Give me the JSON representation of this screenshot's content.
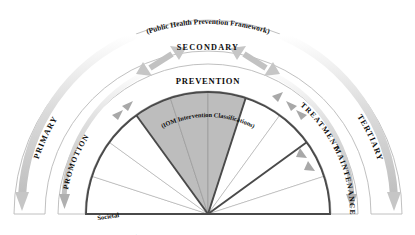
{
  "diagram": {
    "title": "(Public Health Prevention Framework)",
    "center_label_main": "PREVENTION",
    "center_label_sub": "(IOM Intervention Classifications)",
    "outer_ring": {
      "left": "PRIMARY",
      "top": "SECONDARY",
      "right": "TERTIARY"
    },
    "middle_ring": {
      "left": "PROMOTION",
      "right_upper": "TREATMENT",
      "right_lower": "MAINTENANCE"
    },
    "wedges": [
      {
        "label": "Societal",
        "shaded": false
      },
      {
        "label": "Community",
        "shaded": false
      },
      {
        "label": "Individual & Family",
        "shaded": false
      },
      {
        "label": "Universal",
        "shaded": true
      },
      {
        "label": "Selective",
        "shaded": true
      },
      {
        "label": "Indicated",
        "shaded": true
      },
      {
        "label": "Case Identification",
        "shaded": false
      },
      {
        "label": "Treatment of Disorders",
        "shaded": false
      },
      {
        "label": "Long-term Treatment",
        "shaded": false
      },
      {
        "label": "After-care",
        "shaded": false
      }
    ],
    "colors": {
      "shaded_wedge": "#bdbdbd",
      "wedge_outline": "#9a9a9a",
      "disc_border": "#4a4a4a",
      "band_border": "#b9b9b9",
      "arrow": "#c6c6c6",
      "text": "#0d0d0d",
      "background": "#ffffff"
    }
  }
}
